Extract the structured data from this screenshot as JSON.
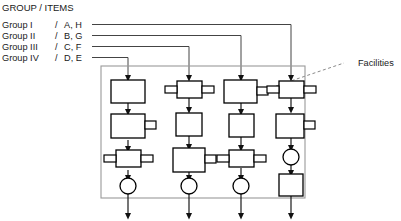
{
  "legend": {
    "title": "GROUP / ITEMS",
    "rows": [
      {
        "group": "Group I",
        "sep": "/",
        "items": "A, H"
      },
      {
        "group": "Group II",
        "sep": "/",
        "items": "B, G"
      },
      {
        "group": "Group III",
        "sep": "/",
        "items": "C, F"
      },
      {
        "group": "Group IV",
        "sep": "/",
        "items": "D, E"
      }
    ]
  },
  "callouts": {
    "facilities": "Facilities"
  },
  "colors": {
    "stroke": "#000000",
    "line": "#111111",
    "feeder": "#444444",
    "boundary": "#9a9a9a",
    "leader": "#8a8a8a",
    "fill": "#ffffff",
    "text": "#1a1a1a"
  },
  "diagram": {
    "type": "process-flow-matrix",
    "columns": 4,
    "rows": 4,
    "boundary": {
      "x": 101,
      "y": 66,
      "width": 204,
      "height": 132
    },
    "column_centers": [
      128,
      189,
      241,
      291
    ],
    "row_centers": [
      93,
      127,
      159,
      186
    ],
    "feeders": [
      {
        "group": "Group I",
        "target_column": 4
      },
      {
        "group": "Group II",
        "target_column": 3
      },
      {
        "group": "Group III",
        "target_column": 2
      },
      {
        "group": "Group IV",
        "target_column": 1
      }
    ],
    "nodes": [
      {
        "column": 1,
        "row": 1,
        "shape": "box",
        "tabs": "none"
      },
      {
        "column": 1,
        "row": 2,
        "shape": "box",
        "tabs": "right"
      },
      {
        "column": 1,
        "row": 3,
        "shape": "box",
        "tabs": "both"
      },
      {
        "column": 1,
        "row": 4,
        "shape": "circle",
        "tabs": "none"
      },
      {
        "column": 2,
        "row": 1,
        "shape": "box",
        "tabs": "both"
      },
      {
        "column": 2,
        "row": 2,
        "shape": "box",
        "tabs": "none"
      },
      {
        "column": 2,
        "row": 3,
        "shape": "box",
        "tabs": "right"
      },
      {
        "column": 2,
        "row": 4,
        "shape": "circle",
        "tabs": "none"
      },
      {
        "column": 3,
        "row": 1,
        "shape": "box",
        "tabs": "right"
      },
      {
        "column": 3,
        "row": 2,
        "shape": "box",
        "tabs": "none"
      },
      {
        "column": 3,
        "row": 3,
        "shape": "box",
        "tabs": "both"
      },
      {
        "column": 3,
        "row": 4,
        "shape": "circle",
        "tabs": "none"
      },
      {
        "column": 4,
        "row": 1,
        "shape": "box",
        "tabs": "both"
      },
      {
        "column": 4,
        "row": 2,
        "shape": "box",
        "tabs": "right"
      },
      {
        "column": 4,
        "row": 3,
        "shape": "circle",
        "tabs": "none"
      },
      {
        "column": 4,
        "row": 4,
        "shape": "box",
        "tabs": "none"
      }
    ],
    "outputs": [
      {
        "column": 1,
        "arrow": "down"
      },
      {
        "column": 2,
        "arrow": "down"
      },
      {
        "column": 3,
        "arrow": "down"
      },
      {
        "column": 4,
        "arrow": "down"
      }
    ]
  }
}
